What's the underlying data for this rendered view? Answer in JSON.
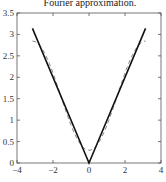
{
  "chart_data": {
    "type": "line",
    "title": "Fourier approximation.",
    "xlabel": "",
    "ylabel": "",
    "xlim": [
      -4,
      4
    ],
    "ylim": [
      0,
      3.5
    ],
    "xticks": [
      -4,
      -2,
      0,
      2,
      4
    ],
    "xtick_labels": [
      "−4",
      "−2",
      "0",
      "2",
      "4"
    ],
    "yticks": [
      0,
      0.5,
      1,
      1.5,
      2,
      2.5,
      3,
      3.5
    ],
    "ytick_labels": [
      "0",
      "0.5",
      "1",
      "1.5",
      "2",
      "2.5",
      "3",
      "3.5"
    ],
    "grid": false,
    "legend": null,
    "series": [
      {
        "name": "|x|",
        "style": "solid",
        "color": "#111111",
        "x": [
          -3.1416,
          0,
          3.1416
        ],
        "y": [
          3.1416,
          0,
          3.1416
        ]
      },
      {
        "name": "Fourier approximation (π/2 − (4/π)cos x)",
        "style": "dashed",
        "color": "#777777",
        "x": [
          -3.1416,
          -2.5,
          -2.0,
          -1.5,
          -1.0,
          -0.5,
          0,
          0.5,
          1.0,
          1.5,
          2.0,
          2.5,
          3.1416
        ],
        "y": [
          2.844,
          2.591,
          2.101,
          1.481,
          0.883,
          0.453,
          0.297,
          0.453,
          0.883,
          1.481,
          2.101,
          2.591,
          2.844
        ]
      }
    ]
  }
}
